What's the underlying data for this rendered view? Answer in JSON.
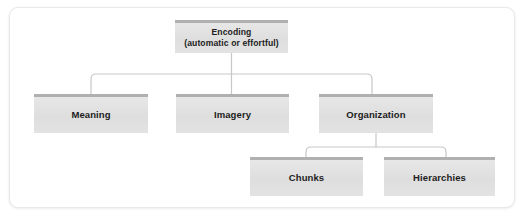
{
  "diagram": {
    "type": "hierarchy-tree",
    "nodes": [
      {
        "id": "encoding",
        "label": "Encoding\n(automatic or effortful)",
        "level": 0
      },
      {
        "id": "meaning",
        "label": "Meaning",
        "level": 1
      },
      {
        "id": "imagery",
        "label": "Imagery",
        "level": 1
      },
      {
        "id": "organization",
        "label": "Organization",
        "level": 1
      },
      {
        "id": "chunks",
        "label": "Chunks",
        "level": 2
      },
      {
        "id": "hierarchies",
        "label": "Hierarchies",
        "level": 2
      }
    ],
    "edges": [
      {
        "from": "encoding",
        "to": "meaning"
      },
      {
        "from": "encoding",
        "to": "imagery"
      },
      {
        "from": "encoding",
        "to": "organization"
      },
      {
        "from": "organization",
        "to": "chunks"
      },
      {
        "from": "organization",
        "to": "hierarchies"
      }
    ],
    "colors": {
      "node_fill": "#e2e2e2",
      "node_accent": "#b0b0b0",
      "connector": "#c7c7c7",
      "text": "#1c1c1c",
      "frame_border": "#e9e9e9",
      "background": "#ffffff"
    }
  }
}
